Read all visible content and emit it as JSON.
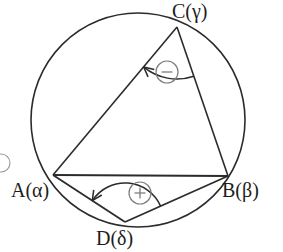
{
  "figure": {
    "stroke_color": "#2b2b2b",
    "background_color": "#ffffff",
    "circle": {
      "cx": 138,
      "cy": 120,
      "r": 107
    },
    "vertices": [
      {
        "id": "C",
        "label_main": "C",
        "label_greek": "γ",
        "label": "C(γ)",
        "x": 177,
        "y": 27
      },
      {
        "id": "A",
        "label_main": "A",
        "label_greek": "α",
        "label": "A(α)",
        "x": 53,
        "y": 175
      },
      {
        "id": "B",
        "label_main": "B",
        "label_greek": "β",
        "label": "B(β)",
        "x": 228,
        "y": 176
      },
      {
        "id": "D",
        "label_main": "D",
        "label_greek": "δ",
        "label": "D(δ)",
        "x": 125,
        "y": 222
      }
    ],
    "chords": [
      {
        "name": "chord-AB",
        "from": "A",
        "to": "B"
      },
      {
        "name": "chord-AC",
        "from": "A",
        "to": "C"
      },
      {
        "name": "chord-CB",
        "from": "C",
        "to": "B"
      },
      {
        "name": "chord-AD",
        "from": "A",
        "to": "D"
      },
      {
        "name": "chord-DB",
        "from": "D",
        "to": "B"
      }
    ],
    "angle_markers": [
      {
        "name": "angle-arc-at-C",
        "vertex": "C",
        "sign": "−",
        "sign_name": "minus",
        "badge": {
          "cx": 167,
          "cy": 72,
          "r": 11
        },
        "orientation": "clockwise-arrow-toward-CA"
      },
      {
        "name": "angle-arc-at-D",
        "vertex": "D",
        "sign": "+",
        "sign_name": "plus",
        "badge": {
          "cx": 140,
          "cy": 193,
          "r": 11
        },
        "orientation": "clockwise-arrow-toward-DA"
      }
    ],
    "edge_artifacts": [
      {
        "name": "clipped-badge-left-edge",
        "cx": 1,
        "cy": 163,
        "r": 9
      }
    ]
  }
}
